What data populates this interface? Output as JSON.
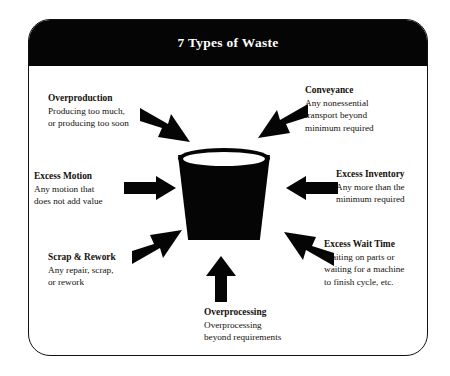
{
  "header": {
    "title": "7 Types of Waste"
  },
  "colors": {
    "frame_border": "#111111",
    "titlebar_background": "#050505",
    "titlebar_text": "#ffffff",
    "arrow_fill": "#050505",
    "bucket_fill": "#050505",
    "page_background": "#ffffff",
    "label_text": "#15100c"
  },
  "center": {
    "icon_name": "waste-bucket-icon"
  },
  "wastes": [
    {
      "id": "overproduction",
      "heading": "Overproduction",
      "lines": [
        "Producing too much,",
        "or producing too soon"
      ],
      "arrow_direction": "down-right",
      "position": "top-left"
    },
    {
      "id": "conveyance",
      "heading": "Conveyance",
      "lines": [
        "Any nonessential",
        "transport beyond",
        "minimum required"
      ],
      "arrow_direction": "down-left",
      "position": "top-right"
    },
    {
      "id": "excess-motion",
      "heading": "Excess Motion",
      "lines": [
        "Any motion that",
        "does not add value"
      ],
      "arrow_direction": "right",
      "position": "middle-left"
    },
    {
      "id": "excess-inventory",
      "heading": "Excess Inventory",
      "lines": [
        "Any more than the",
        "minimum required"
      ],
      "arrow_direction": "left",
      "position": "middle-right"
    },
    {
      "id": "scrap-rework",
      "heading": "Scrap & Rework",
      "lines": [
        "Any repair, scrap,",
        "or rework"
      ],
      "arrow_direction": "up-right",
      "position": "bottom-left"
    },
    {
      "id": "excess-wait-time",
      "heading": "Excess Wait Time",
      "lines": [
        "Waiting on parts or",
        "waiting for a machine",
        "to finish cycle, etc."
      ],
      "arrow_direction": "up-left",
      "position": "bottom-right"
    },
    {
      "id": "overprocessing",
      "heading": "Overprocessing",
      "lines": [
        "Overprocessing",
        "beyond requirements"
      ],
      "arrow_direction": "up",
      "position": "bottom-center"
    }
  ]
}
